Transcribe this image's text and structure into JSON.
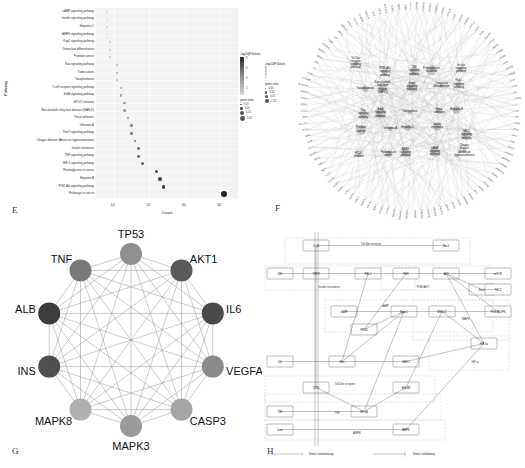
{
  "figure": {
    "panels": [
      {
        "letter": "E",
        "name": "kegg-dotplot"
      },
      {
        "letter": "F",
        "name": "gene-pathway-network"
      },
      {
        "letter": "G",
        "name": "hub-gene-ppi-network"
      },
      {
        "letter": "H",
        "name": "integrated-pathway-diagram"
      }
    ]
  },
  "panelE": {
    "letter": "E",
    "ylabel": "Pathway",
    "xlabel": "Count",
    "xticks": [
      "10",
      "20",
      "30",
      "40"
    ],
    "legend_color_title": "-log10(P.Value)",
    "legend_color_ticks": [
      "8",
      "6",
      "4",
      "2"
    ],
    "legend_size_title": "gene ratio",
    "legend_size_values": [
      "0.05",
      "0.10",
      "0.15",
      "0.20"
    ],
    "chart_data": {
      "type": "scatter",
      "title": "",
      "xlabel": "Count",
      "ylabel": "Pathway",
      "xlim": [
        5,
        45
      ],
      "grid": true,
      "categories": [
        "cAMP signaling pathway",
        "Insulin signaling pathway",
        "Hepatitis C",
        "AMPK signaling pathway",
        "Rap1 signaling pathway",
        "Osteoclast differentiation",
        "Prostate cancer",
        "Ras signaling pathway",
        "Tuberculosis",
        "Toxoplasmosis",
        "T-cell receptor signaling pathway",
        "ErbB signaling pathway",
        "HTLV-I infection",
        "Non-alcoholic fatty liver disease (NAFLD)",
        "Focal adhesion",
        "Influenza A",
        "FoxO signaling pathway",
        "Chagas disease (American trypanosomiasis)",
        "Insulin resistance",
        "TNF signaling pathway",
        "HIF-1 signaling pathway",
        "Proteoglycans in cancer",
        "Hepatitis B",
        "PI3K-Akt signaling pathway",
        "Pathways in cancer"
      ],
      "values": [
        8,
        8,
        8,
        8,
        9,
        9,
        9,
        11,
        11,
        11,
        12,
        12,
        13,
        13,
        14,
        15,
        15,
        16,
        17,
        17,
        18,
        22,
        23,
        24,
        41
      ],
      "pvalues": [
        2.1,
        2.2,
        2.3,
        2.4,
        2.6,
        2.7,
        2.8,
        3.2,
        3.3,
        3.4,
        3.7,
        3.8,
        4.2,
        4.3,
        4.7,
        5.0,
        5.1,
        5.4,
        5.8,
        5.9,
        6.2,
        6.9,
        7.2,
        7.6,
        8.6
      ],
      "generatio": [
        0.045,
        0.045,
        0.045,
        0.045,
        0.05,
        0.05,
        0.05,
        0.062,
        0.062,
        0.062,
        0.068,
        0.068,
        0.073,
        0.073,
        0.079,
        0.085,
        0.085,
        0.09,
        0.096,
        0.096,
        0.102,
        0.124,
        0.13,
        0.135,
        0.231
      ]
    }
  },
  "panelF": {
    "letter": "F",
    "legend_color_title": "-log10(P.Value)",
    "legend_color_ticks": [
      "8",
      "6",
      "4",
      "2"
    ],
    "legend_size_title": "gene ratio",
    "legend_size_values": [
      "0.05",
      "0.10",
      "0.15",
      "0.20"
    ],
    "pathway_nodes": [
      "Toll-like receptor signaling pathway",
      "PI3K-Akt signaling pathway",
      "TNF signaling pathway",
      "Proteoglycans in cancer",
      "Insulin signaling pathway",
      "Toxoplasmosis",
      "Non-alcoholic fatty liver disease (NAFLD)",
      "FoxO signaling pathway",
      "Osteoclast differentiation",
      "Rap1 signaling pathway",
      "Ras signaling pathway",
      "ErbB signaling pathway",
      "Tuberculosis",
      "Focal adhesion",
      "Hepatitis B",
      "Prostate cancer",
      "Influenza A",
      "Hepatitis C",
      "Insulin resistance",
      "HIF-1 signaling pathway",
      "HTLV-I infection",
      "Pathways in cancer",
      "AMPK signaling pathway",
      "cAMP signaling pathway",
      "Chagas disease (American trypanosomiasis)"
    ],
    "gene_nodes": [
      "CASP3",
      "CASP8",
      "CASP9",
      "CCND1",
      "CDKN1A",
      "CREB1",
      "CXCL8",
      "EGF",
      "EGFR",
      "ERBB2",
      "FASLG",
      "FGF2",
      "FOS",
      "GSK3B",
      "HIF1A",
      "HRAS",
      "ICAM1",
      "IFNG",
      "IGF1",
      "IGF1R",
      "IKBKB",
      "IL10",
      "IL1B",
      "IL2",
      "IL2RA",
      "IL4",
      "IL6",
      "INS",
      "INSR",
      "IRS1",
      "JAK2",
      "JUN",
      "KRAS",
      "MAPK1",
      "MAPK3",
      "MAPK8",
      "MAPK14",
      "MDM2",
      "MMP2",
      "MMP9",
      "MTOR",
      "MYC",
      "NFKB1",
      "NFKBIA",
      "NOS2",
      "NOS3",
      "NRAS",
      "PIK3CA",
      "PIK3CB",
      "PIK3CD",
      "PIK3CG",
      "PIK3R1",
      "PPARG",
      "PRKAA1",
      "PRKCA",
      "PTEN",
      "PTGS2",
      "RAF1",
      "RELA",
      "RHOA",
      "SIRT1",
      "SOD1",
      "SRC",
      "STAT1",
      "STAT3",
      "TGFB1",
      "TLR2",
      "TLR4",
      "TNF",
      "TP53",
      "VEGFA",
      "AKT1",
      "ALB",
      "BAX",
      "BCL2",
      "BCL2L1",
      "CAT",
      "CCL2",
      "CDK2",
      "CDK4",
      "SMAD3",
      "SERPINE1",
      "CTNNB1",
      "ESR1",
      "F3",
      "FN1",
      "GSR",
      "HMOX1",
      "HSPA4",
      "ITGB1",
      "LEP",
      "MPO",
      "NFE2L2",
      "PARP1",
      "PLAU",
      "PPARA",
      "PRKCB",
      "RB1",
      "SELE",
      "SLC2A4",
      "SOD2",
      "TIMP1",
      "XIAP"
    ]
  },
  "panelG": {
    "letter": "G",
    "chart_data": {
      "type": "network",
      "layout": "circle",
      "nodes": [
        {
          "label": "TP53",
          "degree": 11,
          "shade": "#8f8f8f"
        },
        {
          "label": "AKT1",
          "degree": 11,
          "shade": "#5a5a5a"
        },
        {
          "label": "IL6",
          "degree": 11,
          "shade": "#4a4a4a"
        },
        {
          "label": "VEGFA",
          "degree": 10,
          "shade": "#8a8a8a"
        },
        {
          "label": "CASP3",
          "degree": 10,
          "shade": "#a5a5a5"
        },
        {
          "label": "MAPK3",
          "degree": 10,
          "shade": "#9a9a9a"
        },
        {
          "label": "MAPK8",
          "degree": 10,
          "shade": "#b0b0b0"
        },
        {
          "label": "INS",
          "degree": 11,
          "shade": "#4f4f4f"
        },
        {
          "label": "ALB",
          "degree": 11,
          "shade": "#3c3c3c"
        },
        {
          "label": "TNF",
          "degree": 11,
          "shade": "#7a7a7a"
        }
      ],
      "fully_connected": true
    }
  },
  "panelH": {
    "letter": "H",
    "legend": [
      {
        "label": "Direct stimulatory",
        "marker": "arrow"
      },
      {
        "label": "Direct inhibitory",
        "marker": "bar"
      }
    ],
    "groups": [
      {
        "label": "Toll-like receptor",
        "name": "group-tlr-top"
      },
      {
        "label": "Insulin resistance",
        "name": "group-insulin-resistance"
      },
      {
        "label": "PI3K/AKT",
        "name": "group-pi3k-akt"
      },
      {
        "label": "cAMP",
        "name": "group-camp"
      },
      {
        "label": "MAPK",
        "name": "group-mapk"
      },
      {
        "label": "HIF-α",
        "name": "group-hif"
      },
      {
        "label": "Toll-like receptor",
        "name": "group-tlr-bottom"
      },
      {
        "label": "TNF",
        "name": "group-tnf"
      },
      {
        "label": "AMPK",
        "name": "group-ampk"
      }
    ],
    "nodes": [
      {
        "label": "IL-1β",
        "name": "node-il1b"
      },
      {
        "label": "Ras1",
        "name": "node-ras1"
      },
      {
        "label": "INS",
        "name": "node-ins"
      },
      {
        "label": "TNFR",
        "name": "node-tnfr"
      },
      {
        "label": "IRS-1",
        "name": "node-irs1"
      },
      {
        "label": "PI3K",
        "name": "node-pi3k"
      },
      {
        "label": "AKT",
        "name": "node-akt"
      },
      {
        "label": "mTOR",
        "name": "node-mtor"
      },
      {
        "label": "FoxO",
        "name": "node-foxo"
      },
      {
        "label": "TSC1",
        "name": "node-tsc1"
      },
      {
        "label": "cAMP",
        "name": "node-camp"
      },
      {
        "label": "Epac1",
        "name": "node-epac1"
      },
      {
        "label": "MEK1/2",
        "name": "node-mek"
      },
      {
        "label": "PI3K-Akt/PK",
        "name": "node-pi3kaktpk"
      },
      {
        "label": "PKCθ",
        "name": "node-pkc"
      },
      {
        "label": "IL6",
        "name": "node-il6"
      },
      {
        "label": "Ras",
        "name": "node-ras"
      },
      {
        "label": "MEK1",
        "name": "node-mek1"
      },
      {
        "label": "HIF-1α",
        "name": "node-hif1a"
      },
      {
        "label": "TLR4",
        "name": "node-tlr4"
      },
      {
        "label": "MyD88",
        "name": "node-myd88"
      },
      {
        "label": "TNF",
        "name": "node-tnf"
      },
      {
        "label": "NF-κB",
        "name": "node-nfkb"
      },
      {
        "label": "Irisin",
        "name": "node-irisin"
      },
      {
        "label": "AMPK",
        "name": "node-ampk"
      }
    ]
  }
}
